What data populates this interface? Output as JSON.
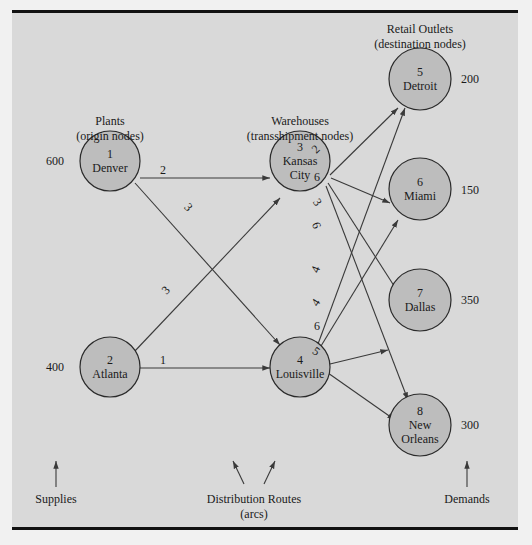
{
  "headers": {
    "plants": {
      "line1": "Plants",
      "line2": "(origin nodes)"
    },
    "warehouses": {
      "line1": "Warehouses",
      "line2": "(transshipment nodes)"
    },
    "retail": {
      "line1": "Retail Outlets",
      "line2": "(destination nodes)"
    }
  },
  "nodes": [
    {
      "id": "1",
      "name": "Denver",
      "type": "origin",
      "supply": "600"
    },
    {
      "id": "2",
      "name": "Atlanta",
      "type": "origin",
      "supply": "400"
    },
    {
      "id": "3",
      "name_line1": "Kansas",
      "name_line2": "City",
      "type": "transshipment"
    },
    {
      "id": "4",
      "name": "Louisville",
      "type": "transshipment"
    },
    {
      "id": "5",
      "name": "Detroit",
      "type": "destination",
      "demand": "200"
    },
    {
      "id": "6",
      "name": "Miami",
      "type": "destination",
      "demand": "150"
    },
    {
      "id": "7",
      "name": "Dallas",
      "type": "destination",
      "demand": "350"
    },
    {
      "id": "8",
      "name_line1": "New",
      "name_line2": "Orleans",
      "type": "destination",
      "demand": "300"
    }
  ],
  "arcs": [
    {
      "from": "1",
      "to": "3",
      "cost": "2"
    },
    {
      "from": "1",
      "to": "4",
      "cost": "3"
    },
    {
      "from": "2",
      "to": "3",
      "cost": "3"
    },
    {
      "from": "2",
      "to": "4",
      "cost": "1"
    },
    {
      "from": "3",
      "to": "5",
      "cost": "2"
    },
    {
      "from": "3",
      "to": "6",
      "cost": "6"
    },
    {
      "from": "3",
      "to": "7",
      "cost": "3"
    },
    {
      "from": "3",
      "to": "8",
      "cost": "6"
    },
    {
      "from": "4",
      "to": "5",
      "cost": "4"
    },
    {
      "from": "4",
      "to": "6",
      "cost": "4"
    },
    {
      "from": "4",
      "to": "7",
      "cost": "6"
    },
    {
      "from": "4",
      "to": "8",
      "cost": "5"
    }
  ],
  "footer": {
    "supplies": "Supplies",
    "routes_line1": "Distribution Routes",
    "routes_line2": "(arcs)",
    "demands": "Demands"
  },
  "colors": {
    "panel_bg": "#d9d9d9",
    "node_fill": "#bdbdbd",
    "line": "#3a3a3a",
    "border": "#111111"
  }
}
